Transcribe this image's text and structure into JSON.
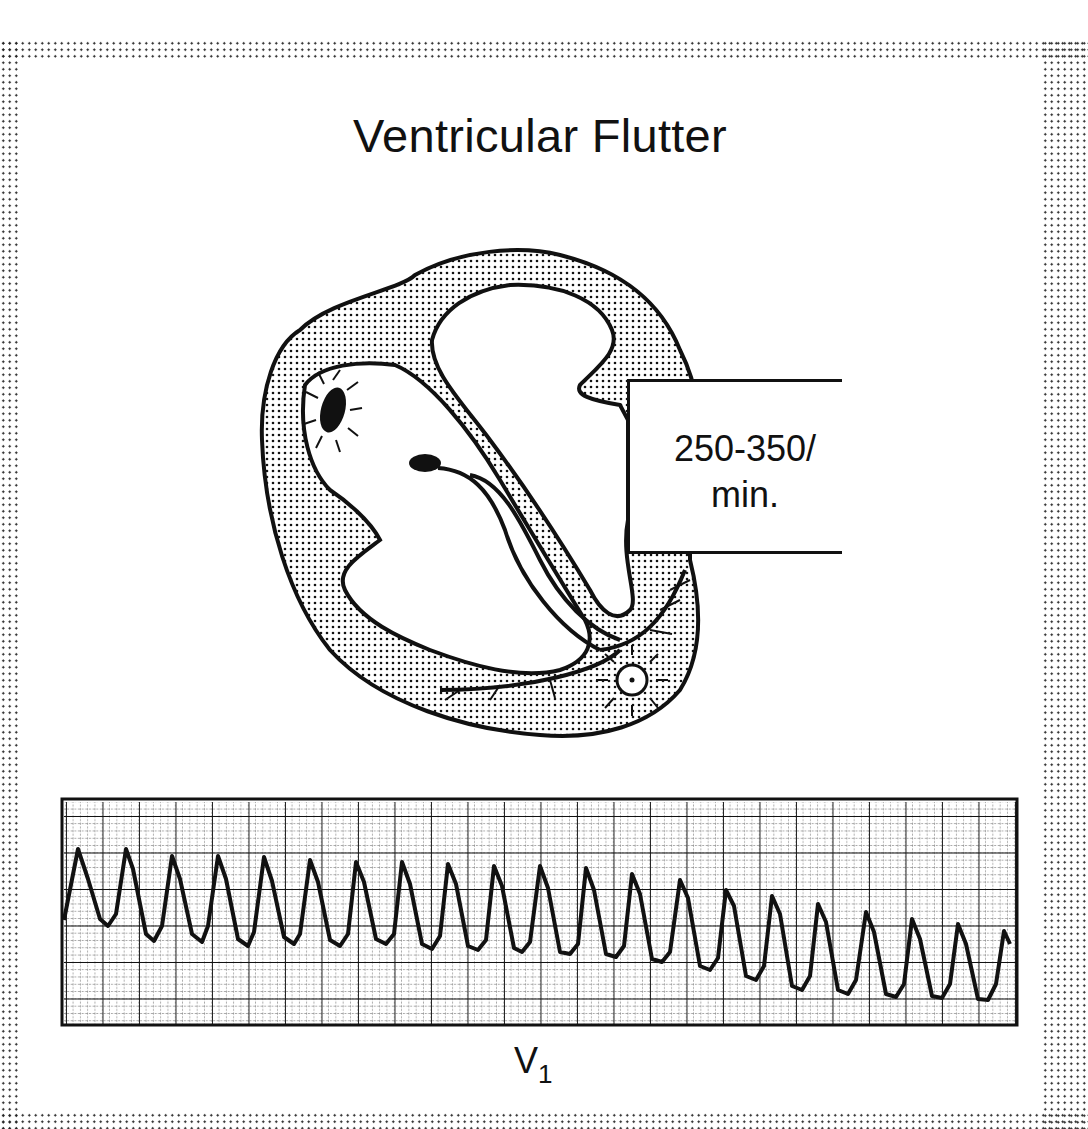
{
  "title": "Ventricular Flutter",
  "rate_label": {
    "line1": "250-350/",
    "line2": "min."
  },
  "ecg": {
    "lead_main": "V",
    "lead_sub": "1",
    "complex_count": 21,
    "grid": "major/minor ECG paper grid"
  },
  "illustration": {
    "subject": "heart cross-section with ectopic ventricular focus",
    "icons": [
      "heart-diagram",
      "sa-node-sunburst",
      "ventricular-focus-sunburst",
      "conduction-bundle"
    ]
  },
  "colors": {
    "ink": "#111111",
    "paper": "#ffffff",
    "stipple": "#222222"
  }
}
